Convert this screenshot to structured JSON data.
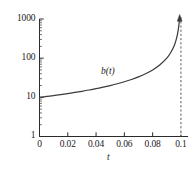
{
  "chart_data": {
    "type": "line",
    "title": "",
    "xlabel": "t",
    "ylabel": "",
    "yscale": "log",
    "xscale": "linear",
    "xlim": [
      0,
      0.105
    ],
    "ylim": [
      1,
      1000
    ],
    "grid": false,
    "legend": "none",
    "x_ticks": [
      {
        "value": 0,
        "label": "0"
      },
      {
        "value": 0.02,
        "label": "0.02"
      },
      {
        "value": 0.04,
        "label": "0.04"
      },
      {
        "value": 0.06,
        "label": "0.06"
      },
      {
        "value": 0.08,
        "label": "0.08"
      },
      {
        "value": 0.1,
        "label": "0.1"
      }
    ],
    "y_ticks": [
      {
        "value": 1,
        "label": "1"
      },
      {
        "value": 10,
        "label": "10"
      },
      {
        "value": 100,
        "label": "100"
      },
      {
        "value": 1000,
        "label": "1000"
      }
    ],
    "y_minor_ticks": [
      2,
      3,
      4,
      5,
      6,
      7,
      8,
      9,
      20,
      30,
      40,
      50,
      60,
      70,
      80,
      90,
      200,
      300,
      400,
      500,
      600,
      700,
      800,
      900
    ],
    "series": [
      {
        "name": "b(t)",
        "annotation": "b(t)",
        "color": "#3a3a3a",
        "style": "solid",
        "points": [
          {
            "x": 0.0,
            "y": 10.0
          },
          {
            "x": 0.005,
            "y": 10.53
          },
          {
            "x": 0.01,
            "y": 11.11
          },
          {
            "x": 0.015,
            "y": 11.76
          },
          {
            "x": 0.02,
            "y": 12.5
          },
          {
            "x": 0.025,
            "y": 13.33
          },
          {
            "x": 0.03,
            "y": 14.29
          },
          {
            "x": 0.035,
            "y": 15.38
          },
          {
            "x": 0.04,
            "y": 16.67
          },
          {
            "x": 0.045,
            "y": 18.18
          },
          {
            "x": 0.05,
            "y": 20.0
          },
          {
            "x": 0.055,
            "y": 22.22
          },
          {
            "x": 0.06,
            "y": 25.0
          },
          {
            "x": 0.065,
            "y": 28.57
          },
          {
            "x": 0.07,
            "y": 33.33
          },
          {
            "x": 0.075,
            "y": 40.0
          },
          {
            "x": 0.08,
            "y": 50.0
          },
          {
            "x": 0.085,
            "y": 66.67
          },
          {
            "x": 0.09,
            "y": 100.0
          },
          {
            "x": 0.0925,
            "y": 133.3
          },
          {
            "x": 0.095,
            "y": 200.0
          },
          {
            "x": 0.0965,
            "y": 285.7
          },
          {
            "x": 0.0975,
            "y": 400.0
          },
          {
            "x": 0.0983,
            "y": 588.2
          },
          {
            "x": 0.0988,
            "y": 833.3
          },
          {
            "x": 0.0991,
            "y": 1000.0
          }
        ]
      }
    ],
    "asymptote": {
      "name": "vertical-asymptote",
      "x": 0.1,
      "style": "dashed",
      "color": "#4a4a4a"
    },
    "arrow_marker": {
      "name": "curve-arrowhead",
      "x": 0.0991,
      "y": 1000
    }
  }
}
